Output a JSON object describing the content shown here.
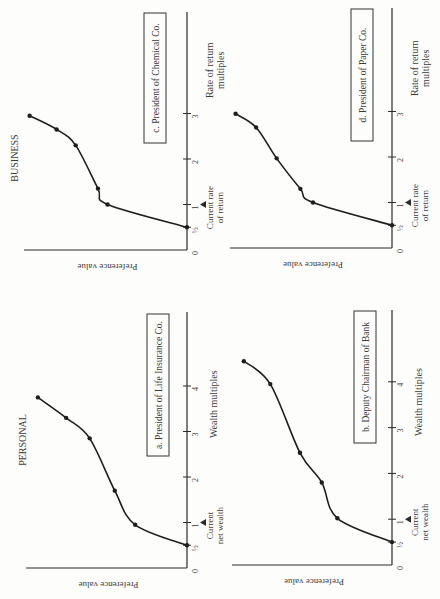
{
  "chart_data": [
    {
      "id": "a",
      "type": "line",
      "group": "PERSONAL",
      "title": "a.  President of Life Insurance Co.",
      "xlabel": "Wealth multiples",
      "ylabel": "Preference value",
      "xticks": [
        "0",
        "½",
        "1",
        "2",
        "3",
        "4"
      ],
      "xtick_values": [
        0,
        0.5,
        1,
        2,
        3,
        4
      ],
      "marker_label": "Current net wealth",
      "marker_at": 1,
      "xlim": [
        0,
        5.3
      ],
      "ylim": [
        0,
        1
      ],
      "points": [
        [
          0.5,
          0.0
        ],
        [
          0.95,
          0.33
        ],
        [
          1.7,
          0.46
        ],
        [
          2.85,
          0.62
        ],
        [
          3.3,
          0.77
        ],
        [
          3.75,
          0.95
        ]
      ]
    },
    {
      "id": "b",
      "type": "line",
      "group": "PERSONAL",
      "title": "b.  Deputy Chairman of Bank",
      "xlabel": "Wealth multiples",
      "ylabel": "Preference value",
      "xticks": [
        "0",
        "½",
        "1",
        "2",
        "3",
        "4"
      ],
      "xtick_values": [
        0,
        0.5,
        1,
        2,
        3,
        4
      ],
      "marker_label": "Current net wealth",
      "marker_at": 1,
      "xlim": [
        0,
        5.6
      ],
      "ylim": [
        0,
        1
      ],
      "points": [
        [
          0.5,
          0.0
        ],
        [
          1.02,
          0.35
        ],
        [
          1.8,
          0.45
        ],
        [
          2.45,
          0.59
        ],
        [
          3.95,
          0.78
        ],
        [
          4.45,
          0.95
        ]
      ]
    },
    {
      "id": "c",
      "type": "line",
      "group": "BUSINESS",
      "title": "c.  President of Chemical Co.",
      "xlabel": "Rate of return multiples",
      "ylabel": "Preference value",
      "xticks": [
        "0",
        "½",
        "1",
        "2",
        "3"
      ],
      "xtick_values": [
        0,
        0.5,
        1,
        2,
        3
      ],
      "marker_label": "Current rate of return",
      "marker_at": 1,
      "xlim": [
        0,
        5.2
      ],
      "ylim": [
        0,
        1
      ],
      "points": [
        [
          0.5,
          0.0
        ],
        [
          1.0,
          0.5
        ],
        [
          1.35,
          0.56
        ],
        [
          2.3,
          0.7
        ],
        [
          2.65,
          0.82
        ],
        [
          2.95,
          0.99
        ]
      ]
    },
    {
      "id": "d",
      "type": "line",
      "group": "BUSINESS",
      "title": "d.  President of Paper Co.",
      "xlabel": "Rate of return multiples",
      "ylabel": "Preference value",
      "xticks": [
        "0",
        "½",
        "1",
        "2",
        "3"
      ],
      "xtick_values": [
        0,
        0.5,
        1,
        2,
        3
      ],
      "marker_label": "Current rate of return",
      "marker_at": 1,
      "xlim": [
        0,
        5.2
      ],
      "ylim": [
        0,
        1
      ],
      "points": [
        [
          0.5,
          0.0
        ],
        [
          1.0,
          0.5
        ],
        [
          1.3,
          0.58
        ],
        [
          1.97,
          0.73
        ],
        [
          2.65,
          0.86
        ],
        [
          2.95,
          0.99
        ]
      ]
    }
  ],
  "headers": {
    "personal": "PERSONAL",
    "business": "BUSINESS"
  },
  "layout_note": "Figure is printed rotated 90 degrees clockwise"
}
